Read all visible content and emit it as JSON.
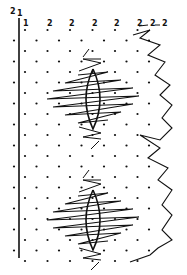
{
  "diagram": {
    "type": "bobbin-lace-pricking",
    "colors": {
      "ink": "#111111",
      "background": "#ffffff"
    },
    "labels": [
      {
        "text": "2",
        "x": 10,
        "y": 14
      },
      {
        "text": "1",
        "x": 17,
        "y": 16
      },
      {
        "text": "1",
        "x": 23,
        "y": 26
      },
      {
        "text": "2",
        "x": 47,
        "y": 26
      },
      {
        "text": "2",
        "x": 69,
        "y": 26
      },
      {
        "text": "2",
        "x": 92,
        "y": 26
      },
      {
        "text": "2",
        "x": 114,
        "y": 26
      },
      {
        "text": "2",
        "x": 137,
        "y": 26
      },
      {
        "text": "2",
        "x": 150,
        "y": 26
      },
      {
        "text": "2",
        "x": 162,
        "y": 26
      }
    ],
    "motifs": [
      {
        "name": "upper-spider",
        "cx": 93,
        "cy": 99
      },
      {
        "name": "lower-spider",
        "cx": 93,
        "cy": 220
      }
    ]
  }
}
